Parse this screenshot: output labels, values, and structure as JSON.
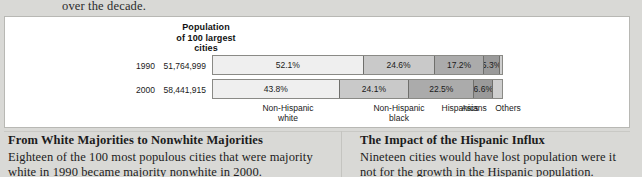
{
  "lede": "over the decade.",
  "chart_panel": {
    "title_lines": [
      "Population",
      "of 100 largest",
      "cities"
    ]
  },
  "chart_data": {
    "type": "bar",
    "orientation": "horizontal-stacked",
    "title": "Population of 100 largest cities",
    "xlabel": "",
    "ylabel": "",
    "categories": [
      "Non-Hispanic white",
      "Non-Hispanic black",
      "Hispanics",
      "Asians",
      "Others"
    ],
    "category_labels": [
      {
        "line1": "Non-Hispanic",
        "line2": "white"
      },
      {
        "line1": "Non-Hispanic",
        "line2": "black"
      },
      {
        "line1": "Hispanics",
        "line2": ""
      },
      {
        "line1": "Asians",
        "line2": ""
      },
      {
        "line1": "Others",
        "line2": ""
      }
    ],
    "rows": [
      {
        "year": "1990",
        "population": "51,764,999",
        "values": [
          52.1,
          24.6,
          17.2,
          5.3,
          0.8
        ],
        "labels": [
          "52.1%",
          "24.6%",
          "17.2%",
          "5.3%",
          ""
        ]
      },
      {
        "year": "2000",
        "population": "58,441,915",
        "values": [
          43.8,
          24.1,
          22.5,
          6.6,
          3.0
        ],
        "labels": [
          "43.8%",
          "24.1%",
          "22.5%",
          "6.6%",
          ""
        ]
      }
    ],
    "units": "percent",
    "xlim": [
      0,
      100
    ],
    "grid": false,
    "legend": "bottom-axis-labels",
    "segment_colors": [
      "#efefef",
      "#c9c9c9",
      "#ababab",
      "#9a9a9a",
      "#cfcfcf"
    ]
  },
  "footer": {
    "left": {
      "heading": "From White Majorities to Nonwhite Majorities",
      "body": "Eighteen of the 100 most populous cities that were majority white in 1990 became majority nonwhite in 2000."
    },
    "right": {
      "heading": "The Impact of the Hispanic Influx",
      "body": "Nineteen cities would have lost population were it not for the growth in the Hispanic population."
    }
  }
}
